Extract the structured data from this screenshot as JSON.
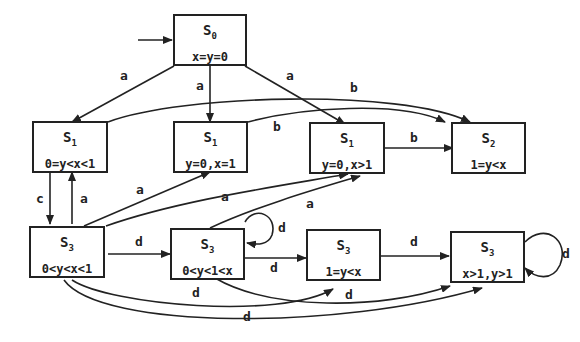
{
  "diagram": {
    "type": "state-transition-diagram",
    "colors": {
      "stroke": "#222222",
      "background": "#ffffff"
    },
    "nodes": [
      {
        "id": "n0",
        "state": "S",
        "sub": "0",
        "label": "x=y=0"
      },
      {
        "id": "n1",
        "state": "S",
        "sub": "1",
        "label": "0=y<x<1"
      },
      {
        "id": "n2",
        "state": "S",
        "sub": "1",
        "label": "y=0,x=1"
      },
      {
        "id": "n3",
        "state": "S",
        "sub": "1",
        "label": "y=0,x>1"
      },
      {
        "id": "n4",
        "state": "S",
        "sub": "2",
        "label": "1=y<x"
      },
      {
        "id": "n5",
        "state": "S",
        "sub": "3",
        "label": "0<y<x<1"
      },
      {
        "id": "n6",
        "state": "S",
        "sub": "3",
        "label": "0<y<1<x"
      },
      {
        "id": "n7",
        "state": "S",
        "sub": "3",
        "label": "1=y<x"
      },
      {
        "id": "n8",
        "state": "S",
        "sub": "3",
        "label": "x>1,y>1"
      }
    ],
    "edges": [
      {
        "from": "start",
        "to": "n0",
        "label": ""
      },
      {
        "from": "n0",
        "to": "n1",
        "label": "a"
      },
      {
        "from": "n0",
        "to": "n2",
        "label": "a"
      },
      {
        "from": "n0",
        "to": "n3",
        "label": "a"
      },
      {
        "from": "n1",
        "to": "n4",
        "label": "b"
      },
      {
        "from": "n2",
        "to": "n4",
        "label": "b"
      },
      {
        "from": "n3",
        "to": "n4",
        "label": "b"
      },
      {
        "from": "n1",
        "to": "n5",
        "label": "c"
      },
      {
        "from": "n5",
        "to": "n1",
        "label": "a"
      },
      {
        "from": "n5",
        "to": "n2",
        "label": "a"
      },
      {
        "from": "n5",
        "to": "n3",
        "label": "a"
      },
      {
        "from": "n6",
        "to": "n3",
        "label": "a"
      },
      {
        "from": "n5",
        "to": "n6",
        "label": "d"
      },
      {
        "from": "n6",
        "to": "n6",
        "label": "d"
      },
      {
        "from": "n6",
        "to": "n7",
        "label": "d"
      },
      {
        "from": "n7",
        "to": "n8",
        "label": "d"
      },
      {
        "from": "n8",
        "to": "n8",
        "label": "d"
      },
      {
        "from": "n5",
        "to": "n7",
        "label": "d"
      },
      {
        "from": "n6",
        "to": "n8",
        "label": "d"
      },
      {
        "from": "n5",
        "to": "n8",
        "label": "d"
      }
    ]
  }
}
